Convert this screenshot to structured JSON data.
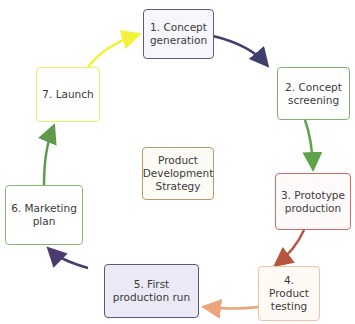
{
  "diagram": {
    "title_partial": "",
    "center": {
      "label": "Product\nDevelopment\nStrategy",
      "border": "#b89a6a",
      "fill": "#fdfbf6"
    },
    "steps": [
      {
        "number": 1,
        "label": "1. Concept\ngeneration",
        "border": "#5d5e78",
        "fill": "#f7f7fb",
        "arrow_color": "#3f3f6e"
      },
      {
        "number": 2,
        "label": "2. Concept\nscreening",
        "border": "#7fb56a",
        "fill": "#ffffff",
        "arrow_color": "#5fa24a"
      },
      {
        "number": 3,
        "label": "3. Prototype\nproduction",
        "border": "#d46a6a",
        "fill": "#fffafa",
        "arrow_color": "#b8553f"
      },
      {
        "number": 4,
        "label": "4. Product\ntesting",
        "border": "#f3c2a2",
        "fill": "#fffaf6",
        "arrow_color": "#eea47a"
      },
      {
        "number": 5,
        "label": "5. First\nproduction run",
        "border": "#5b5476",
        "fill": "#ebe9f5",
        "arrow_color": "#4a3a6e"
      },
      {
        "number": 6,
        "label": "6. Marketing\nplan",
        "border": "#86b874",
        "fill": "#ffffff",
        "arrow_color": "#5f9a4e"
      },
      {
        "number": 7,
        "label": "7. Launch",
        "border": "#efef6a",
        "fill": "#ffffff",
        "arrow_color": "#f2f23a"
      }
    ]
  }
}
